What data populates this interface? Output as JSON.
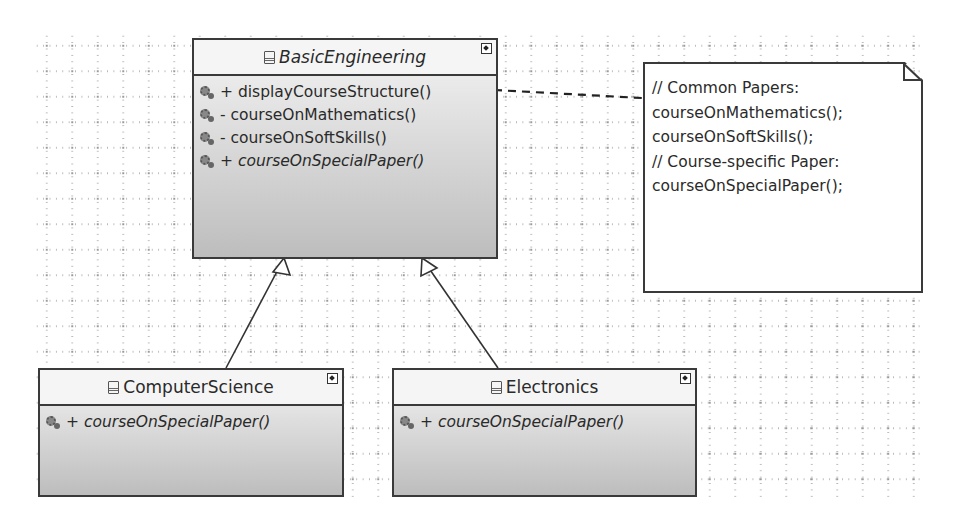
{
  "diagram": {
    "type": "UML class diagram",
    "classes": [
      {
        "name": "BasicEngineering",
        "abstract": true,
        "operations": [
          {
            "visibility": "+",
            "signature": "displayCourseStructure()",
            "italic": false
          },
          {
            "visibility": "-",
            "signature": "courseOnMathematics()",
            "italic": false
          },
          {
            "visibility": "-",
            "signature": "courseOnSoftSkills()",
            "italic": false
          },
          {
            "visibility": "+",
            "signature": "courseOnSpecialPaper()",
            "italic": true
          }
        ]
      },
      {
        "name": "ComputerScience",
        "abstract": false,
        "operations": [
          {
            "visibility": "+",
            "signature": "courseOnSpecialPaper()",
            "italic": true
          }
        ]
      },
      {
        "name": "Electronics",
        "abstract": false,
        "operations": [
          {
            "visibility": "+",
            "signature": "courseOnSpecialPaper()",
            "italic": true
          }
        ]
      }
    ],
    "note": {
      "lines": [
        "// Common Papers:",
        "courseOnMathematics();",
        "courseOnSoftSkills();",
        "// Course-specific Paper:",
        "courseOnSpecialPaper();"
      ],
      "attached_to": "BasicEngineering.displayCourseStructure()"
    },
    "relationships": [
      {
        "type": "generalization",
        "from": "ComputerScience",
        "to": "BasicEngineering"
      },
      {
        "type": "generalization",
        "from": "Electronics",
        "to": "BasicEngineering"
      },
      {
        "type": "note-anchor",
        "from": "note",
        "to": "BasicEngineering"
      }
    ],
    "icons": {
      "class": "class-icon",
      "public_method": "public-method-gear-icon",
      "private_method": "private-method-gear-icon",
      "link": "shortcut-link-icon"
    }
  }
}
